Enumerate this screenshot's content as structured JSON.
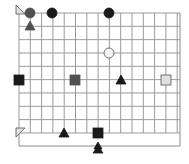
{
  "board": {
    "grid": {
      "x0": 19,
      "y0": 13,
      "cols": 15,
      "rows": 10,
      "col_spacing": 11.3,
      "row_spacing": 13.33,
      "right_edge": 180,
      "bottom_grid": 133,
      "outer_bottom": 146,
      "line_color": "#9a9a9a",
      "border_color": "#8a8a8a"
    },
    "colors": {
      "black": "#1a1a1a",
      "dark_gray": "#505050",
      "light_gray": "#e0e0e0",
      "white": "#f4f4f4",
      "outline": "#555555"
    },
    "pieces": [
      {
        "name": "corner-marker-top-left",
        "shape": "corner-triangle-top",
        "x": 19,
        "y": 13,
        "color": "light_gray"
      },
      {
        "name": "circle-dark-gray-1",
        "shape": "circle",
        "x": 30,
        "y": 13,
        "color": "dark_gray"
      },
      {
        "name": "circle-black-1",
        "shape": "circle",
        "x": 52,
        "y": 13,
        "color": "black"
      },
      {
        "name": "circle-black-2",
        "shape": "circle",
        "x": 109,
        "y": 13,
        "color": "black"
      },
      {
        "name": "triangle-dark-gray-1",
        "shape": "triangle",
        "x": 30,
        "y": 26,
        "color": "dark_gray"
      },
      {
        "name": "circle-white-1",
        "shape": "circle",
        "x": 109,
        "y": 53,
        "color": "white"
      },
      {
        "name": "square-black-1",
        "shape": "square",
        "x": 19,
        "y": 80,
        "color": "black"
      },
      {
        "name": "square-dark-gray-1",
        "shape": "square",
        "x": 75,
        "y": 80,
        "color": "dark_gray"
      },
      {
        "name": "triangle-black-1",
        "shape": "triangle",
        "x": 121,
        "y": 80,
        "color": "black"
      },
      {
        "name": "square-light-gray-1",
        "shape": "square",
        "x": 166,
        "y": 80,
        "color": "light_gray"
      },
      {
        "name": "corner-marker-bottom-left",
        "shape": "corner-triangle-bottom",
        "x": 19,
        "y": 133,
        "color": "light_gray"
      },
      {
        "name": "triangle-black-2",
        "shape": "triangle",
        "x": 64,
        "y": 133,
        "color": "black"
      },
      {
        "name": "square-black-2",
        "shape": "square",
        "x": 98,
        "y": 133,
        "color": "black"
      },
      {
        "name": "triangle-stack-black",
        "shape": "triangle-stack",
        "x": 98,
        "y": 148,
        "color": "black"
      }
    ]
  }
}
